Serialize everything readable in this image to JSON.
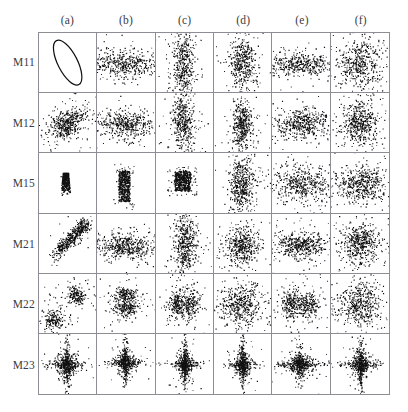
{
  "figure": {
    "type": "scatter-matrix",
    "background_color": "#ffffff",
    "grid_line_color": "#8d8d93",
    "point_color": "#101010",
    "label_color": "#3b3b41"
  },
  "columns": [
    {
      "label": "(a)"
    },
    {
      "label": "(b)"
    },
    {
      "label": "(c)"
    },
    {
      "label": "(d)"
    },
    {
      "label": "(e)"
    },
    {
      "label": "(f)"
    }
  ],
  "rows": [
    {
      "label": "M11"
    },
    {
      "label": "M12"
    },
    {
      "label": "M15"
    },
    {
      "label": "M21"
    },
    {
      "label": "M22"
    },
    {
      "label": "M23"
    }
  ],
  "chart_data": {
    "type": "scatter",
    "title": "",
    "xlabel": "",
    "ylabel": "",
    "grid": true,
    "legend": "none",
    "categories": [
      "(a)",
      "(b)",
      "(c)",
      "(d)",
      "(e)",
      "(f)"
    ],
    "row_categories": [
      "M11",
      "M12",
      "M15",
      "M21",
      "M22",
      "M23"
    ],
    "cells": [
      {
        "row": "M11",
        "col": "(a)",
        "shape": "ellipse-outline",
        "n_points": 0,
        "cx": 0.5,
        "cy": 0.5,
        "rx": 0.17,
        "ry": 0.42,
        "rotation": -28,
        "spread_x": 0.0,
        "spread_y": 0.0,
        "outlier_fraction": 0.0
      },
      {
        "row": "M11",
        "col": "(b)",
        "shape": "horizontal-band",
        "n_points": 520,
        "cx": 0.48,
        "cy": 0.52,
        "spread_x": 0.3,
        "spread_y": 0.11,
        "outlier_fraction": 0.22
      },
      {
        "row": "M11",
        "col": "(c)",
        "shape": "vertical-band",
        "n_points": 520,
        "cx": 0.47,
        "cy": 0.5,
        "spread_x": 0.09,
        "spread_y": 0.33,
        "outlier_fraction": 0.24
      },
      {
        "row": "M11",
        "col": "(d)",
        "shape": "vertical-blob",
        "n_points": 470,
        "cx": 0.5,
        "cy": 0.52,
        "spread_x": 0.12,
        "spread_y": 0.22,
        "outlier_fraction": 0.2
      },
      {
        "row": "M11",
        "col": "(e)",
        "shape": "horizontal-band",
        "n_points": 520,
        "cx": 0.5,
        "cy": 0.52,
        "spread_x": 0.3,
        "spread_y": 0.09,
        "outlier_fraction": 0.22
      },
      {
        "row": "M11",
        "col": "(f)",
        "shape": "round-blob",
        "n_points": 520,
        "cx": 0.48,
        "cy": 0.5,
        "spread_x": 0.18,
        "spread_y": 0.21,
        "outlier_fraction": 0.2
      },
      {
        "row": "M12",
        "col": "(a)",
        "shape": "diagonal-blob",
        "n_points": 520,
        "cx": 0.5,
        "cy": 0.5,
        "spread_x": 0.19,
        "spread_y": 0.21,
        "rotation": -35,
        "outlier_fraction": 0.18
      },
      {
        "row": "M12",
        "col": "(b)",
        "shape": "horizontal-blob",
        "n_points": 520,
        "cx": 0.49,
        "cy": 0.52,
        "spread_x": 0.24,
        "spread_y": 0.11,
        "outlier_fraction": 0.2
      },
      {
        "row": "M12",
        "col": "(c)",
        "shape": "vertical-band",
        "n_points": 520,
        "cx": 0.47,
        "cy": 0.5,
        "spread_x": 0.1,
        "spread_y": 0.3,
        "outlier_fraction": 0.2
      },
      {
        "row": "M12",
        "col": "(d)",
        "shape": "vertical-blob",
        "n_points": 470,
        "cx": 0.49,
        "cy": 0.52,
        "spread_x": 0.09,
        "spread_y": 0.19,
        "outlier_fraction": 0.2
      },
      {
        "row": "M12",
        "col": "(e)",
        "shape": "horizontal-blob",
        "n_points": 520,
        "cx": 0.5,
        "cy": 0.51,
        "spread_x": 0.24,
        "spread_y": 0.12,
        "outlier_fraction": 0.2
      },
      {
        "row": "M12",
        "col": "(f)",
        "shape": "round-blob",
        "n_points": 540,
        "cx": 0.48,
        "cy": 0.5,
        "spread_x": 0.17,
        "spread_y": 0.19,
        "outlier_fraction": 0.14
      },
      {
        "row": "M15",
        "col": "(a)",
        "shape": "wedge",
        "n_points": 420,
        "cx": 0.46,
        "cy": 0.52,
        "spread_x": 0.09,
        "spread_y": 0.19,
        "outlier_fraction": 0.02
      },
      {
        "row": "M15",
        "col": "(b)",
        "shape": "rect-block",
        "n_points": 620,
        "cx": 0.47,
        "cy": 0.56,
        "spread_x": 0.1,
        "spread_y": 0.26,
        "outlier_fraction": 0.08
      },
      {
        "row": "M15",
        "col": "(c)",
        "shape": "rect-block",
        "n_points": 600,
        "cx": 0.46,
        "cy": 0.47,
        "spread_x": 0.14,
        "spread_y": 0.17,
        "outlier_fraction": 0.1
      },
      {
        "row": "M15",
        "col": "(d)",
        "shape": "vertical-blob",
        "n_points": 520,
        "cx": 0.48,
        "cy": 0.52,
        "spread_x": 0.11,
        "spread_y": 0.22,
        "outlier_fraction": 0.18
      },
      {
        "row": "M15",
        "col": "(e)",
        "shape": "horizontal-blob",
        "n_points": 560,
        "cx": 0.49,
        "cy": 0.52,
        "spread_x": 0.26,
        "spread_y": 0.15,
        "outlier_fraction": 0.2
      },
      {
        "row": "M15",
        "col": "(f)",
        "shape": "horizontal-blob",
        "n_points": 560,
        "cx": 0.49,
        "cy": 0.52,
        "spread_x": 0.22,
        "spread_y": 0.14,
        "outlier_fraction": 0.2
      },
      {
        "row": "M21",
        "col": "(a)",
        "shape": "diagonal-streak",
        "n_points": 520,
        "cx": 0.52,
        "cy": 0.44,
        "spread_x": 0.17,
        "spread_y": 0.17,
        "rotation": -40,
        "outlier_fraction": 0.12
      },
      {
        "row": "M21",
        "col": "(b)",
        "shape": "horizontal-blob",
        "n_points": 540,
        "cx": 0.49,
        "cy": 0.54,
        "spread_x": 0.25,
        "spread_y": 0.11,
        "outlier_fraction": 0.2
      },
      {
        "row": "M21",
        "col": "(c)",
        "shape": "vertical-blob",
        "n_points": 520,
        "cx": 0.5,
        "cy": 0.5,
        "spread_x": 0.1,
        "spread_y": 0.25,
        "outlier_fraction": 0.2
      },
      {
        "row": "M21",
        "col": "(d)",
        "shape": "round-blob",
        "n_points": 500,
        "cx": 0.49,
        "cy": 0.52,
        "spread_x": 0.14,
        "spread_y": 0.17,
        "outlier_fraction": 0.2
      },
      {
        "row": "M21",
        "col": "(e)",
        "shape": "horizontal-blob",
        "n_points": 540,
        "cx": 0.5,
        "cy": 0.52,
        "spread_x": 0.24,
        "spread_y": 0.11,
        "outlier_fraction": 0.2
      },
      {
        "row": "M21",
        "col": "(f)",
        "shape": "round-blob",
        "n_points": 540,
        "cx": 0.49,
        "cy": 0.5,
        "spread_x": 0.16,
        "spread_y": 0.18,
        "outlier_fraction": 0.16
      },
      {
        "row": "M22",
        "col": "(a)",
        "shape": "two-clusters-diagonal",
        "n_points": 420,
        "cx": 0.35,
        "cy": 0.62,
        "spread_x": 0.14,
        "spread_y": 0.12,
        "outlier_fraction": 0.3
      },
      {
        "row": "M22",
        "col": "(b)",
        "shape": "two-clusters-vertical",
        "n_points": 440,
        "cx": 0.5,
        "cy": 0.45,
        "spread_x": 0.16,
        "spread_y": 0.12,
        "outlier_fraction": 0.3
      },
      {
        "row": "M22",
        "col": "(c)",
        "shape": "two-clusters-horizontal",
        "n_points": 480,
        "cx": 0.48,
        "cy": 0.5,
        "spread_x": 0.17,
        "spread_y": 0.16,
        "outlier_fraction": 0.26
      },
      {
        "row": "M22",
        "col": "(d)",
        "shape": "round-blob",
        "n_points": 560,
        "cx": 0.48,
        "cy": 0.52,
        "spread_x": 0.18,
        "spread_y": 0.18,
        "outlier_fraction": 0.24
      },
      {
        "row": "M22",
        "col": "(e)",
        "shape": "two-clusters-horizontal",
        "n_points": 520,
        "cx": 0.48,
        "cy": 0.52,
        "spread_x": 0.2,
        "spread_y": 0.15,
        "outlier_fraction": 0.26
      },
      {
        "row": "M22",
        "col": "(f)",
        "shape": "round-blob",
        "n_points": 560,
        "cx": 0.48,
        "cy": 0.5,
        "spread_x": 0.17,
        "spread_y": 0.19,
        "outlier_fraction": 0.26
      },
      {
        "row": "M23",
        "col": "(a)",
        "shape": "four-point-star",
        "n_points": 620,
        "cx": 0.48,
        "cy": 0.5,
        "spread_x": 0.16,
        "spread_y": 0.24,
        "outlier_fraction": 0.14
      },
      {
        "row": "M23",
        "col": "(b)",
        "shape": "four-point-star",
        "n_points": 600,
        "cx": 0.49,
        "cy": 0.47,
        "spread_x": 0.15,
        "spread_y": 0.2,
        "outlier_fraction": 0.16
      },
      {
        "row": "M23",
        "col": "(c)",
        "shape": "four-point-star",
        "n_points": 600,
        "cx": 0.5,
        "cy": 0.5,
        "spread_x": 0.12,
        "spread_y": 0.24,
        "outlier_fraction": 0.14
      },
      {
        "row": "M23",
        "col": "(d)",
        "shape": "four-point-star",
        "n_points": 600,
        "cx": 0.49,
        "cy": 0.5,
        "spread_x": 0.13,
        "spread_y": 0.23,
        "outlier_fraction": 0.16
      },
      {
        "row": "M23",
        "col": "(e)",
        "shape": "horizontal-star",
        "n_points": 600,
        "cx": 0.48,
        "cy": 0.5,
        "spread_x": 0.22,
        "spread_y": 0.15,
        "outlier_fraction": 0.16
      },
      {
        "row": "M23",
        "col": "(f)",
        "shape": "vertical-star",
        "n_points": 600,
        "cx": 0.5,
        "cy": 0.5,
        "spread_x": 0.14,
        "spread_y": 0.23,
        "outlier_fraction": 0.16
      }
    ]
  }
}
